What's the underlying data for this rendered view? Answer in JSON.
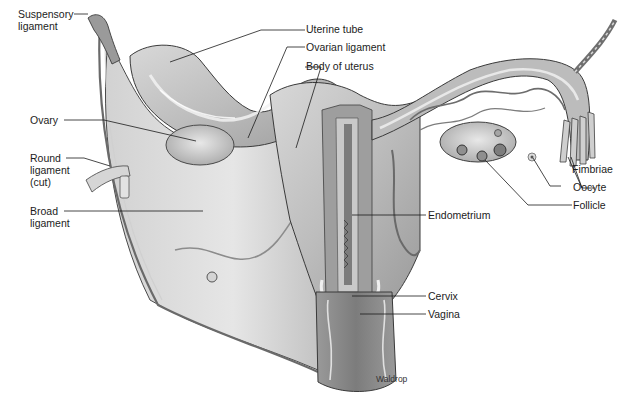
{
  "figure": {
    "credit": "Waldrop",
    "palette": {
      "background": "#ffffff",
      "tissue_light": "#e4e4e4",
      "tissue_mid": "#b9b9b9",
      "tissue_dark": "#7a7a7a",
      "outline": "#3a3a3a",
      "leader_line": "#1a1a1a"
    }
  },
  "labels": {
    "suspensory_ligament": {
      "line1": "Suspensory",
      "line2": "ligament"
    },
    "ovary": {
      "text": "Ovary"
    },
    "round_ligament": {
      "line1": "Round",
      "line2": "ligament",
      "line3": "(cut)"
    },
    "broad_ligament": {
      "line1": "Broad",
      "line2": "ligament"
    },
    "uterine_tube": {
      "text": "Uterine tube"
    },
    "ovarian_ligament": {
      "text": "Ovarian ligament"
    },
    "body_of_uterus": {
      "text": "Body of uterus"
    },
    "endometrium": {
      "text": "Endometrium"
    },
    "cervix": {
      "text": "Cervix"
    },
    "vagina": {
      "text": "Vagina"
    },
    "fimbriae": {
      "text": "Fimbriae"
    },
    "oocyte": {
      "text": "Oocyte"
    },
    "follicle": {
      "text": "Follicle"
    }
  }
}
